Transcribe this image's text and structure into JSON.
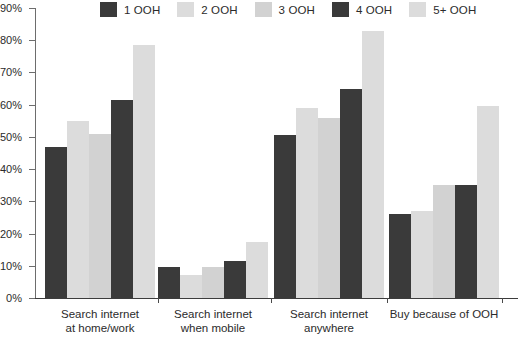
{
  "chart_data": {
    "type": "bar",
    "title": "",
    "xlabel": "",
    "ylabel": "",
    "ylim": [
      0,
      90
    ],
    "ytick_labels": [
      "0%",
      "10%",
      "20%",
      "30%",
      "40%",
      "50%",
      "60%",
      "70%",
      "80%",
      "90%"
    ],
    "ytick_values": [
      0,
      10,
      20,
      30,
      40,
      50,
      60,
      70,
      80,
      90
    ],
    "grid": false,
    "legend_position": "top",
    "categories": [
      "Search internet at home/work",
      "Search internet when mobile",
      "Search internet anywhere",
      "Buy because of OOH"
    ],
    "category_lines": [
      [
        "Search internet",
        "at home/work"
      ],
      [
        "Search internet",
        "when mobile"
      ],
      [
        "Search internet",
        "anywhere"
      ],
      [
        "Buy because of OOH",
        ""
      ]
    ],
    "series": [
      {
        "name": "1 OOH",
        "color": "#3a3a3a",
        "values": [
          47,
          9.5,
          50.5,
          26
        ]
      },
      {
        "name": "2 OOH",
        "color": "#dcdcdc",
        "values": [
          55,
          7,
          59,
          27
        ]
      },
      {
        "name": "3 OOH",
        "color": "#d2d2d2",
        "values": [
          51,
          9.5,
          56,
          35
        ]
      },
      {
        "name": "4 OOH",
        "color": "#3a3a3a",
        "values": [
          61.5,
          11.5,
          65,
          35
        ]
      },
      {
        "name": "5+ OOH",
        "color": "#dcdcdc",
        "values": [
          78.5,
          17.5,
          83,
          59.5
        ]
      }
    ]
  },
  "legend": {
    "items": [
      {
        "label": "1 OOH",
        "color": "#3a3a3a"
      },
      {
        "label": "2 OOH",
        "color": "#dcdcdc"
      },
      {
        "label": "3 OOH",
        "color": "#d2d2d2"
      },
      {
        "label": "4 OOH",
        "color": "#3a3a3a"
      },
      {
        "label": "5+ OOH",
        "color": "#dcdcdc"
      }
    ]
  },
  "axis": {
    "y_labels": [
      "90%",
      "80%",
      "70%",
      "60%",
      "50%",
      "40%",
      "30%",
      "20%",
      "10%",
      "0%"
    ]
  },
  "footer": {
    "partial_note": ""
  }
}
